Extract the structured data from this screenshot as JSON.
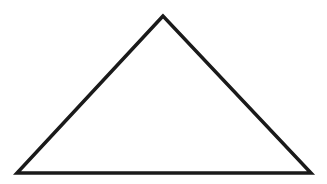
{
  "diagram": {
    "shape": "triangle",
    "vertices": {
      "apex": [
        163,
        16
      ],
      "bottom_left": [
        17,
        173
      ],
      "bottom_right": [
        311,
        173
      ]
    },
    "stroke_color": "#1a1a1a",
    "fill_color": "#ffffff",
    "stroke_width": 3.5,
    "background": "#ffffff"
  }
}
